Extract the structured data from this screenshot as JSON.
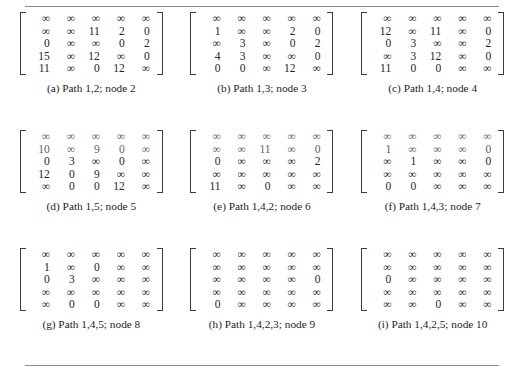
{
  "figure": {
    "infinity_symbol": "∞",
    "panels": [
      {
        "id": "a",
        "caption": "(a) Path 1,2; node 2",
        "tint": "",
        "rows": [
          [
            "∞",
            "∞",
            "∞",
            "∞",
            "∞"
          ],
          [
            "∞",
            "∞",
            "11",
            "2",
            "0"
          ],
          [
            "0",
            "∞",
            "∞",
            "0",
            "2"
          ],
          [
            "15",
            "∞",
            "12",
            "∞",
            "0"
          ],
          [
            "11",
            "∞",
            "0",
            "12",
            "∞"
          ]
        ]
      },
      {
        "id": "b",
        "caption": "(b) Path 1,3; node 3",
        "tint": "",
        "rows": [
          [
            "∞",
            "∞",
            "∞",
            "∞",
            "∞"
          ],
          [
            "1",
            "∞",
            "∞",
            "2",
            "0"
          ],
          [
            "∞",
            "3",
            "∞",
            "0",
            "2"
          ],
          [
            "4",
            "3",
            "∞",
            "∞",
            "0"
          ],
          [
            "0",
            "0",
            "∞",
            "12",
            "∞"
          ]
        ]
      },
      {
        "id": "c",
        "caption": "(c) Path 1,4; node 4",
        "tint": "",
        "rows": [
          [
            "∞",
            "∞",
            "∞",
            "∞",
            "∞"
          ],
          [
            "12",
            "∞",
            "11",
            "∞",
            "0"
          ],
          [
            "0",
            "3",
            "∞",
            "∞",
            "2"
          ],
          [
            "∞",
            "3",
            "12",
            "∞",
            "0"
          ],
          [
            "11",
            "0",
            "0",
            "∞",
            "∞"
          ]
        ]
      },
      {
        "id": "d",
        "caption": "(d) Path 1,5; node 5",
        "tint": "tint-d",
        "rows": [
          [
            "∞",
            "∞",
            "∞",
            "∞",
            "∞"
          ],
          [
            "10",
            "∞",
            "9",
            "0",
            "∞"
          ],
          [
            "0",
            "3",
            "∞",
            "0",
            "∞"
          ],
          [
            "12",
            "0",
            "9",
            "∞",
            "∞"
          ],
          [
            "∞",
            "0",
            "0",
            "12",
            "∞"
          ]
        ]
      },
      {
        "id": "e",
        "caption": "(e) Path 1,4,2; node 6",
        "tint": "tint-e",
        "rows": [
          [
            "∞",
            "∞",
            "∞",
            "∞",
            "∞"
          ],
          [
            "∞",
            "∞",
            "11",
            "∞",
            "0"
          ],
          [
            "0",
            "∞",
            "∞",
            "∞",
            "2"
          ],
          [
            "∞",
            "∞",
            "∞",
            "∞",
            "∞"
          ],
          [
            "11",
            "∞",
            "0",
            "∞",
            "∞"
          ]
        ]
      },
      {
        "id": "f",
        "caption": "(f) Path 1,4,3; node 7",
        "tint": "tint-f",
        "rows": [
          [
            "∞",
            "∞",
            "∞",
            "∞",
            "∞"
          ],
          [
            "1",
            "∞",
            "∞",
            "∞",
            "0"
          ],
          [
            "∞",
            "1",
            "∞",
            "∞",
            "0"
          ],
          [
            "∞",
            "∞",
            "∞",
            "∞",
            "∞"
          ],
          [
            "0",
            "0",
            "∞",
            "∞",
            "∞"
          ]
        ]
      },
      {
        "id": "g",
        "caption": "(g) Path 1,4,5; node 8",
        "tint": "",
        "rows": [
          [
            "∞",
            "∞",
            "∞",
            "∞",
            "∞"
          ],
          [
            "1",
            "∞",
            "0",
            "∞",
            "∞"
          ],
          [
            "0",
            "3",
            "∞",
            "∞",
            "∞"
          ],
          [
            "∞",
            "∞",
            "∞",
            "∞",
            "∞"
          ],
          [
            "∞",
            "0",
            "0",
            "∞",
            "∞"
          ]
        ]
      },
      {
        "id": "h",
        "caption": "(h) Path 1,4,2,3; node 9",
        "tint": "",
        "rows": [
          [
            "∞",
            "∞",
            "∞",
            "∞",
            "∞"
          ],
          [
            "∞",
            "∞",
            "∞",
            "∞",
            "∞"
          ],
          [
            "∞",
            "∞",
            "∞",
            "∞",
            "0"
          ],
          [
            "∞",
            "∞",
            "∞",
            "∞",
            "∞"
          ],
          [
            "0",
            "∞",
            "∞",
            "∞",
            "∞"
          ]
        ]
      },
      {
        "id": "i",
        "caption": "(i) Path 1,4,2,5; node 10",
        "tint": "",
        "rows": [
          [
            "∞",
            "∞",
            "∞",
            "∞",
            "∞"
          ],
          [
            "∞",
            "∞",
            "∞",
            "∞",
            "∞"
          ],
          [
            "0",
            "∞",
            "∞",
            "∞",
            "∞"
          ],
          [
            "∞",
            "∞",
            "∞",
            "∞",
            "∞"
          ],
          [
            "∞",
            "∞",
            "0",
            "∞",
            "∞"
          ]
        ]
      }
    ]
  }
}
